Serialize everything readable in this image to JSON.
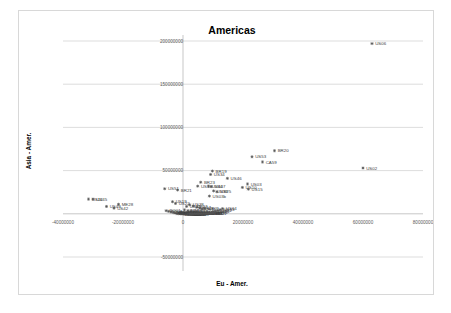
{
  "chart_data": {
    "type": "scatter",
    "title": "Americas",
    "xlabel": "Eu - Amer.",
    "ylabel": "Asia - Amer.",
    "xlim": [
      -40000000,
      80000000
    ],
    "ylim": [
      -50000000,
      200000000
    ],
    "xticks": [
      -40000000,
      -20000000,
      0,
      20000000,
      40000000,
      60000000,
      80000000
    ],
    "xtick_labels": [
      "-40000000",
      "-20000000",
      "0",
      "20000000",
      "40000000",
      "60000000",
      "80000000"
    ],
    "yticks": [
      -50000000,
      50000000,
      100000000,
      150000000,
      200000000
    ],
    "ytick_labels": [
      "-50000000",
      "50000000",
      "100000000",
      "150000000",
      "200000000"
    ],
    "grid": true,
    "legend": false,
    "marker": "diamond",
    "marker_color": "#555555",
    "points": [
      {
        "label": "US06",
        "x": 63000000,
        "y": 197000000
      },
      {
        "label": "US02",
        "x": 60000000,
        "y": 53000000
      },
      {
        "label": "BR20",
        "x": 30500000,
        "y": 73000000
      },
      {
        "label": "US53",
        "x": 23000000,
        "y": 66000000
      },
      {
        "label": "CA59",
        "x": 26500000,
        "y": 60000000
      },
      {
        "label": "BR19",
        "x": 9800000,
        "y": 49500000
      },
      {
        "label": "US34",
        "x": 9200000,
        "y": 45500000
      },
      {
        "label": "US46",
        "x": 14800000,
        "y": 41000000
      },
      {
        "label": "BR23",
        "x": 5900000,
        "y": 36500000
      },
      {
        "label": "US13",
        "x": 4900000,
        "y": 32000000
      },
      {
        "label": "BR21",
        "x": -1800000,
        "y": 27500000
      },
      {
        "label": "US51",
        "x": -6100000,
        "y": 29000000
      },
      {
        "label": "US44",
        "x": 8500000,
        "y": 32000000
      },
      {
        "label": "US07",
        "x": 9400000,
        "y": 31500000
      },
      {
        "label": "US03",
        "x": 21500000,
        "y": 34500000
      },
      {
        "label": "US10",
        "x": 19800000,
        "y": 30500000
      },
      {
        "label": "US15",
        "x": 21800000,
        "y": 28500000
      },
      {
        "label": "US39",
        "x": 10200000,
        "y": 26500000
      },
      {
        "label": "US25",
        "x": 11300000,
        "y": 25500000
      },
      {
        "label": "US12",
        "x": -31500000,
        "y": 17000000
      },
      {
        "label": "US45",
        "x": -30000000,
        "y": 17000000
      },
      {
        "label": "ME28",
        "x": -21500000,
        "y": 11000000
      },
      {
        "label": "US42",
        "x": -23000000,
        "y": 6500000
      },
      {
        "label": "US49",
        "x": -25500000,
        "y": 8500000
      },
      {
        "label": "US03b",
        "x": 8800000,
        "y": 20500000
      },
      {
        "label": "US19",
        "x": -3500000,
        "y": 14000000
      },
      {
        "label": "US22",
        "x": -2500000,
        "y": 12000000
      },
      {
        "label": "US38",
        "x": 2200000,
        "y": 10500000
      },
      {
        "label": "US31",
        "x": 1200000,
        "y": 8500000
      },
      {
        "label": "US27",
        "x": 3400000,
        "y": 9000000
      },
      {
        "label": "US17",
        "x": 4600000,
        "y": 7500000
      },
      {
        "label": "US08",
        "x": 5600000,
        "y": 6500000
      },
      {
        "label": "US11",
        "x": 6400000,
        "y": 5500000
      },
      {
        "label": "US09",
        "x": 7200000,
        "y": 6000000
      },
      {
        "label": "US24",
        "x": 500000,
        "y": 4500000
      },
      {
        "label": "US16",
        "x": 1600000,
        "y": 3500000
      },
      {
        "label": "US33",
        "x": 2600000,
        "y": 3000000
      },
      {
        "label": "US29",
        "x": 3600000,
        "y": 2600000
      },
      {
        "label": "US35",
        "x": 4400000,
        "y": 2200000
      },
      {
        "label": "US41",
        "x": 5200000,
        "y": 2000000
      },
      {
        "label": "US48",
        "x": 6000000,
        "y": 1700000
      },
      {
        "label": "US52",
        "x": 6800000,
        "y": 1500000
      },
      {
        "label": "US55",
        "x": 7600000,
        "y": 1300000
      },
      {
        "label": "US57",
        "x": 8400000,
        "y": 1100000
      },
      {
        "label": "CA01",
        "x": -700000,
        "y": 2000000
      },
      {
        "label": "CA02",
        "x": -200000,
        "y": 1500000
      },
      {
        "label": "CA03",
        "x": 300000,
        "y": 1200000
      },
      {
        "label": "CA04",
        "x": 900000,
        "y": 900000
      },
      {
        "label": "CA05",
        "x": 1500000,
        "y": 700000
      },
      {
        "label": "CA06",
        "x": 2100000,
        "y": 500000
      },
      {
        "label": "CA07",
        "x": 2700000,
        "y": 400000
      },
      {
        "label": "CA08",
        "x": 3300000,
        "y": 300000
      },
      {
        "label": "CA09",
        "x": 3900000,
        "y": 200000
      },
      {
        "label": "CA10",
        "x": 4500000,
        "y": 100000
      },
      {
        "label": "BR01",
        "x": -1200000,
        "y": 600000
      },
      {
        "label": "BR02",
        "x": -600000,
        "y": 400000
      },
      {
        "label": "BR03",
        "x": 0,
        "y": 300000
      },
      {
        "label": "BR04",
        "x": 600000,
        "y": 200000
      },
      {
        "label": "BR05",
        "x": 1200000,
        "y": 100000
      },
      {
        "label": "BR06",
        "x": 1800000,
        "y": 50000
      },
      {
        "label": "BR07",
        "x": 2400000,
        "y": 0
      },
      {
        "label": "BR08",
        "x": 3000000,
        "y": -100000
      },
      {
        "label": "ME01",
        "x": -2000000,
        "y": 200000
      },
      {
        "label": "ME02",
        "x": -1400000,
        "y": 100000
      },
      {
        "label": "ME03",
        "x": -800000,
        "y": 0
      },
      {
        "label": "ME04",
        "x": -300000,
        "y": -100000
      },
      {
        "label": "ME05",
        "x": 200000,
        "y": -200000
      },
      {
        "label": "ME06",
        "x": 800000,
        "y": -300000
      },
      {
        "label": "ME07",
        "x": 1400000,
        "y": -200000
      },
      {
        "label": "ME08",
        "x": 2000000,
        "y": -150000
      },
      {
        "label": "AR01",
        "x": 2600000,
        "y": -100000
      },
      {
        "label": "AR02",
        "x": 3200000,
        "y": -50000
      },
      {
        "label": "AR03",
        "x": 3800000,
        "y": 0
      },
      {
        "label": "AR04",
        "x": 4400000,
        "y": 50000
      },
      {
        "label": "AR05",
        "x": 5000000,
        "y": 100000
      },
      {
        "label": "CL01",
        "x": 5600000,
        "y": 150000
      },
      {
        "label": "CL02",
        "x": 6200000,
        "y": 200000
      },
      {
        "label": "CL03",
        "x": 6800000,
        "y": 250000
      },
      {
        "label": "CO01",
        "x": 7400000,
        "y": 300000
      },
      {
        "label": "CO02",
        "x": 8000000,
        "y": 400000
      },
      {
        "label": "PE01",
        "x": 8600000,
        "y": 500000
      },
      {
        "label": "PE02",
        "x": 9200000,
        "y": 700000
      },
      {
        "label": "VE01",
        "x": 9800000,
        "y": 900000
      },
      {
        "label": "VE02",
        "x": 10400000,
        "y": 1200000
      },
      {
        "label": "EC01",
        "x": -2600000,
        "y": 900000
      },
      {
        "label": "EC02",
        "x": -3200000,
        "y": 1400000
      },
      {
        "label": "UY01",
        "x": -4000000,
        "y": 2000000
      },
      {
        "label": "PY01",
        "x": -4800000,
        "y": 2800000
      },
      {
        "label": "BO01",
        "x": -5600000,
        "y": 3600000
      },
      {
        "label": "US60",
        "x": 10000000,
        "y": 2400000
      },
      {
        "label": "US61",
        "x": 10800000,
        "y": 3000000
      },
      {
        "label": "US62",
        "x": 11600000,
        "y": 3800000
      },
      {
        "label": "US63",
        "x": 12400000,
        "y": 4800000
      },
      {
        "label": "US64",
        "x": 13200000,
        "y": 6000000
      }
    ]
  }
}
